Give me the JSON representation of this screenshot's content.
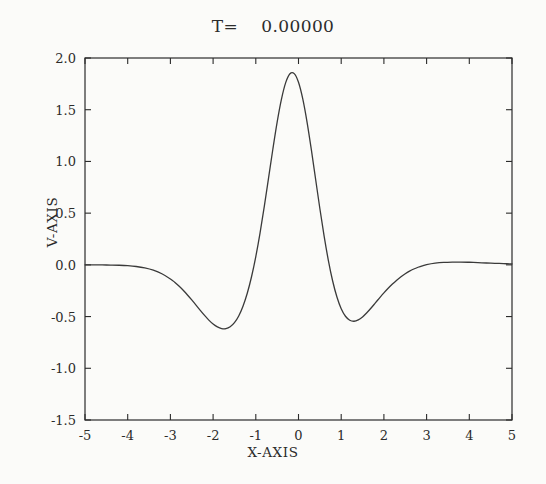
{
  "chart_data": {
    "type": "line",
    "title": "T=    0.00000",
    "xlabel": "X-AXIS",
    "ylabel": "V-AXIS",
    "xlim": [
      -5,
      5
    ],
    "ylim": [
      -1.5,
      2.0
    ],
    "xticks": [
      -5,
      -4,
      -3,
      -2,
      -1,
      0,
      1,
      2,
      3,
      4,
      5
    ],
    "xticklabels": [
      "-5",
      "-4",
      "-3",
      "-2",
      "-1",
      "0",
      "1",
      "2",
      "3",
      "4",
      "5"
    ],
    "yticks": [
      2.0,
      1.5,
      1.0,
      0.5,
      0.0,
      -0.5,
      -1.0,
      -1.5
    ],
    "yticklabels": [
      "2.0",
      "1.5",
      "1.0",
      "0.5",
      "0.0",
      "-0.5",
      "-1.0",
      "-1.5"
    ],
    "grid": false,
    "legend": null,
    "line_color": "#3a3a3a",
    "line_width": 1.3,
    "series": [
      {
        "name": "V(x)",
        "x": [
          -5.0,
          -4.8,
          -4.6,
          -4.4,
          -4.2,
          -4.0,
          -3.8,
          -3.6,
          -3.4,
          -3.2,
          -3.0,
          -2.9,
          -2.8,
          -2.7,
          -2.6,
          -2.5,
          -2.4,
          -2.3,
          -2.2,
          -2.1,
          -2.0,
          -1.9,
          -1.8,
          -1.7,
          -1.6,
          -1.5,
          -1.4,
          -1.3,
          -1.2,
          -1.1,
          -1.0,
          -0.9,
          -0.8,
          -0.7,
          -0.6,
          -0.5,
          -0.4,
          -0.3,
          -0.2,
          -0.1,
          0.0,
          0.1,
          0.2,
          0.3,
          0.4,
          0.5,
          0.6,
          0.7,
          0.8,
          0.9,
          1.0,
          1.1,
          1.2,
          1.3,
          1.4,
          1.5,
          1.6,
          1.7,
          1.8,
          1.9,
          2.0,
          2.1,
          2.2,
          2.3,
          2.4,
          2.5,
          2.6,
          2.7,
          2.8,
          2.9,
          3.0,
          3.2,
          3.4,
          3.6,
          3.8,
          4.0,
          4.2,
          4.4,
          4.6,
          4.8,
          5.0
        ],
        "y": [
          0.0,
          0.0,
          -0.001,
          -0.002,
          -0.004,
          -0.008,
          -0.016,
          -0.03,
          -0.052,
          -0.086,
          -0.136,
          -0.168,
          -0.205,
          -0.246,
          -0.291,
          -0.339,
          -0.389,
          -0.44,
          -0.489,
          -0.534,
          -0.572,
          -0.6,
          -0.616,
          -0.617,
          -0.599,
          -0.559,
          -0.494,
          -0.4,
          -0.275,
          -0.115,
          0.08,
          0.31,
          0.568,
          0.843,
          1.12,
          1.38,
          1.6,
          1.762,
          1.848,
          1.849,
          1.765,
          1.604,
          1.381,
          1.116,
          0.83,
          0.545,
          0.278,
          0.042,
          -0.156,
          -0.311,
          -0.424,
          -0.497,
          -0.535,
          -0.545,
          -0.532,
          -0.503,
          -0.463,
          -0.417,
          -0.368,
          -0.319,
          -0.271,
          -0.226,
          -0.185,
          -0.148,
          -0.115,
          -0.086,
          -0.061,
          -0.04,
          -0.023,
          -0.009,
          0.002,
          0.016,
          0.024,
          0.027,
          0.027,
          0.025,
          0.022,
          0.018,
          0.015,
          0.012,
          0.009
        ]
      }
    ],
    "annotations": {
      "peak": {
        "x": -0.36,
        "y": 1.86
      },
      "left_trough": {
        "x": -2.03,
        "y": -0.7
      },
      "right_trough": {
        "x": 1.0,
        "y": -1.21
      },
      "right_bump": {
        "x": 2.63,
        "y": 0.13
      }
    }
  },
  "plot_box": {
    "left": 85,
    "top": 58,
    "right": 512,
    "bottom": 420
  }
}
